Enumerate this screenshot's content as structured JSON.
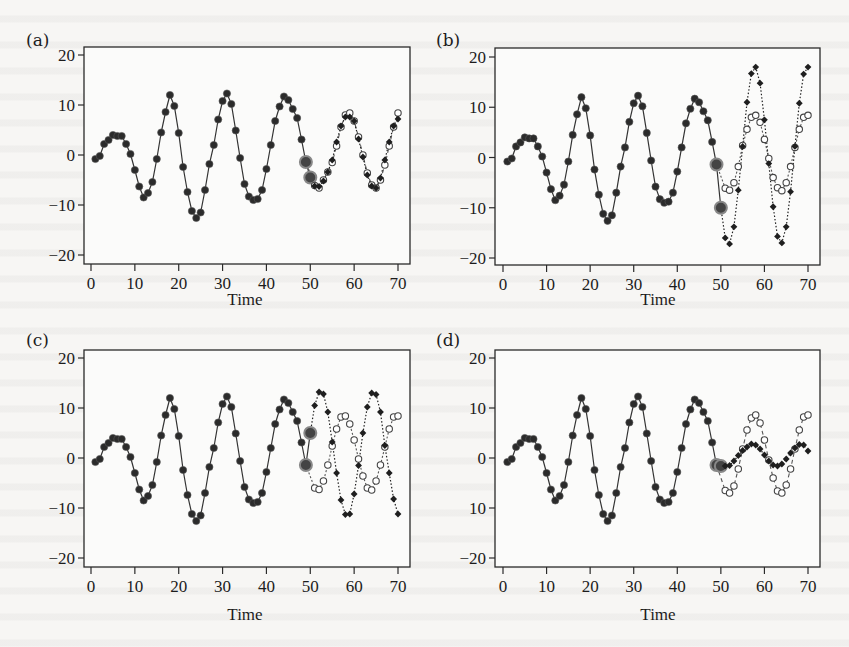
{
  "panels": [
    {
      "id": "a",
      "label": "(a)",
      "xlabel": "Time",
      "yticks": [
        "20",
        "10",
        "0",
        "−10",
        "−20"
      ],
      "xticks": [
        "0",
        "10",
        "20",
        "30",
        "40",
        "50",
        "60",
        "70"
      ]
    },
    {
      "id": "b",
      "label": "(b)",
      "xlabel": "Time",
      "yticks": [
        "20",
        "10",
        "0",
        "−10",
        "−20"
      ],
      "xticks": [
        "0",
        "10",
        "20",
        "30",
        "40",
        "50",
        "60",
        "70"
      ]
    },
    {
      "id": "c",
      "label": "(c)",
      "xlabel": "Time",
      "yticks": [
        "20",
        "10",
        "0",
        "−10",
        "−20"
      ],
      "xticks": [
        "0",
        "10",
        "20",
        "30",
        "40",
        "50",
        "60",
        "70"
      ]
    },
    {
      "id": "d",
      "label": "(d)",
      "xlabel": "Time",
      "yticks": [
        "20",
        "10",
        "0",
        "10",
        "−20"
      ],
      "xticks": [
        "0",
        "10",
        "20",
        "30",
        "40",
        "50",
        "60",
        "70"
      ]
    }
  ],
  "chart_data": [
    {
      "type": "line",
      "panel": "(a)",
      "title": "",
      "xlabel": "Time",
      "ylabel": "",
      "xlim": [
        0,
        70
      ],
      "ylim": [
        -20,
        20
      ],
      "grid": false,
      "legend": null,
      "series": [
        {
          "name": "observed",
          "style": "filled-circle-solid",
          "x": [
            1,
            2,
            3,
            4,
            5,
            6,
            7,
            8,
            9,
            10,
            11,
            12,
            13,
            14,
            15,
            16,
            17,
            18,
            19,
            20,
            21,
            22,
            23,
            24,
            25,
            26,
            27,
            28,
            29,
            30,
            31,
            32,
            33,
            34,
            35,
            36,
            37,
            38,
            39,
            40,
            41,
            42,
            43,
            44,
            45,
            46,
            47,
            48,
            49
          ],
          "values": [
            -0.8,
            -0.2,
            2.2,
            3.0,
            4.0,
            3.8,
            3.8,
            2.2,
            0.2,
            -3.0,
            -6.3,
            -8.5,
            -7.6,
            -5.4,
            -0.8,
            4.5,
            8.6,
            12.0,
            9.8,
            4.4,
            -2.4,
            -7.4,
            -11.2,
            -12.6,
            -11.5,
            -7.0,
            -1.8,
            2.0,
            7.1,
            10.8,
            12.3,
            10.2,
            4.9,
            -0.6,
            -5.8,
            -8.3,
            -9.0,
            -8.8,
            -7.0,
            -2.8,
            2.0,
            6.8,
            9.7,
            11.7,
            11.0,
            9.2,
            7.4,
            3.1,
            -1.4
          ]
        },
        {
          "name": "forecast",
          "style": "filled-diamond-dotted",
          "x": [
            50,
            51,
            52,
            53,
            54,
            55,
            56,
            57,
            58,
            59,
            60,
            61,
            62,
            63,
            64,
            65,
            66,
            67,
            68,
            69,
            70
          ],
          "values": [
            -4.5,
            -6.2,
            -6.3,
            -5.2,
            -3.4,
            -1.0,
            2.6,
            5.8,
            7.6,
            7.6,
            6.8,
            3.2,
            -0.4,
            -4.0,
            -6.2,
            -6.6,
            -4.6,
            -1.0,
            2.6,
            5.8,
            7.2
          ]
        },
        {
          "name": "actual",
          "style": "open-circle-dashed",
          "x": [
            50,
            51,
            52,
            53,
            54,
            55,
            56,
            57,
            58,
            59,
            60,
            61,
            62,
            63,
            64,
            65,
            66,
            67,
            68,
            69,
            70
          ],
          "values": [
            -4.5,
            -6.1,
            -6.6,
            -5.0,
            -3.4,
            -1.5,
            1.8,
            5.6,
            8.0,
            8.4,
            6.8,
            3.6,
            0.0,
            -3.6,
            -6.0,
            -6.6,
            -5.0,
            -2.0,
            1.8,
            5.6,
            8.4
          ]
        }
      ]
    },
    {
      "type": "line",
      "panel": "(b)",
      "title": "",
      "xlabel": "Time",
      "ylabel": "",
      "xlim": [
        0,
        70
      ],
      "ylim": [
        -20,
        20
      ],
      "grid": false,
      "legend": null,
      "series": [
        {
          "name": "observed",
          "style": "filled-circle-solid",
          "x": [
            1,
            2,
            3,
            4,
            5,
            6,
            7,
            8,
            9,
            10,
            11,
            12,
            13,
            14,
            15,
            16,
            17,
            18,
            19,
            20,
            21,
            22,
            23,
            24,
            25,
            26,
            27,
            28,
            29,
            30,
            31,
            32,
            33,
            34,
            35,
            36,
            37,
            38,
            39,
            40,
            41,
            42,
            43,
            44,
            45,
            46,
            47,
            48,
            49
          ],
          "values": [
            -0.8,
            -0.2,
            2.2,
            3.0,
            4.0,
            3.8,
            3.8,
            2.2,
            0.2,
            -3.0,
            -6.3,
            -8.5,
            -7.6,
            -5.4,
            -0.8,
            4.5,
            8.6,
            12.0,
            9.8,
            4.4,
            -2.4,
            -7.4,
            -11.2,
            -12.6,
            -11.5,
            -7.0,
            -1.8,
            2.0,
            7.1,
            10.8,
            12.3,
            10.2,
            4.9,
            -0.6,
            -5.8,
            -8.3,
            -9.0,
            -8.8,
            -7.0,
            -2.8,
            2.0,
            6.8,
            9.7,
            11.7,
            11.0,
            9.2,
            7.4,
            3.1,
            -1.4
          ]
        },
        {
          "name": "forecast",
          "style": "filled-diamond-dotted",
          "x": [
            50,
            51,
            52,
            53,
            54,
            55,
            56,
            57,
            58,
            59,
            60,
            61,
            62,
            63,
            64,
            65,
            66,
            67,
            68,
            69,
            70
          ],
          "values": [
            -10.0,
            -16.0,
            -17.2,
            -13.8,
            -6.5,
            2.2,
            11.0,
            16.7,
            18.0,
            14.8,
            7.5,
            -1.2,
            -9.8,
            -15.7,
            -17.0,
            -13.8,
            -6.8,
            2.2,
            10.8,
            16.6,
            18.0
          ]
        },
        {
          "name": "actual",
          "style": "open-circle-dotted",
          "x": [
            50,
            51,
            52,
            53,
            54,
            55,
            56,
            57,
            58,
            59,
            60,
            61,
            62,
            63,
            64,
            65,
            66,
            67,
            68,
            69,
            70
          ],
          "values": [
            -10.0,
            -6.1,
            -6.5,
            -5.0,
            -1.8,
            2.4,
            5.6,
            8.0,
            8.4,
            7.0,
            3.6,
            -0.2,
            -4.0,
            -6.0,
            -6.6,
            -5.0,
            -1.8,
            2.0,
            5.6,
            8.0,
            8.4
          ]
        }
      ]
    },
    {
      "type": "line",
      "panel": "(c)",
      "title": "",
      "xlabel": "Time",
      "ylabel": "",
      "xlim": [
        0,
        70
      ],
      "ylim": [
        -20,
        20
      ],
      "grid": false,
      "legend": null,
      "series": [
        {
          "name": "observed",
          "style": "filled-circle-solid",
          "x": [
            1,
            2,
            3,
            4,
            5,
            6,
            7,
            8,
            9,
            10,
            11,
            12,
            13,
            14,
            15,
            16,
            17,
            18,
            19,
            20,
            21,
            22,
            23,
            24,
            25,
            26,
            27,
            28,
            29,
            30,
            31,
            32,
            33,
            34,
            35,
            36,
            37,
            38,
            39,
            40,
            41,
            42,
            43,
            44,
            45,
            46,
            47,
            48,
            49
          ],
          "values": [
            -0.8,
            -0.2,
            2.2,
            3.0,
            4.0,
            3.8,
            3.8,
            2.2,
            0.2,
            -3.0,
            -6.3,
            -8.5,
            -7.6,
            -5.4,
            -0.8,
            4.5,
            8.6,
            12.0,
            9.8,
            4.4,
            -2.4,
            -7.4,
            -11.2,
            -12.6,
            -11.5,
            -7.0,
            -1.8,
            2.0,
            7.1,
            10.8,
            12.3,
            10.2,
            4.9,
            -0.6,
            -5.8,
            -8.3,
            -9.0,
            -8.8,
            -7.0,
            -2.8,
            2.0,
            6.8,
            9.7,
            11.7,
            11.0,
            9.2,
            7.4,
            3.1,
            -1.4
          ]
        },
        {
          "name": "forecast",
          "style": "filled-diamond-dotted",
          "x": [
            50,
            51,
            52,
            53,
            54,
            55,
            56,
            57,
            58,
            59,
            60,
            61,
            62,
            63,
            64,
            65,
            66,
            67,
            68,
            69,
            70
          ],
          "values": [
            5.0,
            10.5,
            13.2,
            12.8,
            9.2,
            3.2,
            -3.0,
            -8.4,
            -11.3,
            -11.2,
            -7.2,
            -1.5,
            5.0,
            10.2,
            13.0,
            12.7,
            9.2,
            2.5,
            -3.0,
            -8.2,
            -11.2
          ]
        },
        {
          "name": "actual",
          "style": "open-circle-dotted",
          "x": [
            50,
            51,
            52,
            53,
            54,
            55,
            56,
            57,
            58,
            59,
            60,
            61,
            62,
            63,
            64,
            65,
            66,
            67,
            68,
            69,
            70
          ],
          "values": [
            5.0,
            -6.0,
            -6.3,
            -4.6,
            -1.4,
            2.4,
            5.8,
            8.2,
            8.4,
            6.8,
            3.6,
            -0.2,
            -3.6,
            -6.0,
            -6.4,
            -4.6,
            -1.4,
            2.2,
            5.8,
            8.2,
            8.4
          ]
        }
      ]
    },
    {
      "type": "line",
      "panel": "(d)",
      "title": "",
      "xlabel": "Time",
      "ylabel": "",
      "xlim": [
        0,
        70
      ],
      "ylim": [
        -20,
        20
      ],
      "grid": false,
      "legend": null,
      "series": [
        {
          "name": "observed",
          "style": "filled-circle-solid",
          "x": [
            1,
            2,
            3,
            4,
            5,
            6,
            7,
            8,
            9,
            10,
            11,
            12,
            13,
            14,
            15,
            16,
            17,
            18,
            19,
            20,
            21,
            22,
            23,
            24,
            25,
            26,
            27,
            28,
            29,
            30,
            31,
            32,
            33,
            34,
            35,
            36,
            37,
            38,
            39,
            40,
            41,
            42,
            43,
            44,
            45,
            46,
            47,
            48,
            49
          ],
          "values": [
            -0.8,
            -0.2,
            2.2,
            3.0,
            4.0,
            3.8,
            3.8,
            2.2,
            0.2,
            -3.0,
            -6.3,
            -8.5,
            -7.6,
            -5.4,
            -0.8,
            4.5,
            8.6,
            12.0,
            9.8,
            4.4,
            -2.4,
            -7.4,
            -11.2,
            -12.6,
            -11.5,
            -7.0,
            -1.8,
            2.0,
            7.1,
            10.8,
            12.3,
            10.2,
            4.9,
            -0.6,
            -5.8,
            -8.3,
            -9.0,
            -8.8,
            -7.0,
            -2.8,
            2.0,
            6.8,
            9.7,
            11.7,
            11.0,
            9.2,
            7.4,
            3.1,
            -1.4
          ]
        },
        {
          "name": "forecast",
          "style": "filled-diamond-dotted",
          "x": [
            50,
            51,
            52,
            53,
            54,
            55,
            56,
            57,
            58,
            59,
            60,
            61,
            62,
            63,
            64,
            65,
            66,
            67,
            68,
            69,
            70
          ],
          "values": [
            -1.6,
            -1.6,
            -1.5,
            -0.6,
            0.5,
            1.5,
            2.2,
            2.8,
            2.6,
            1.8,
            0.6,
            -0.6,
            -1.4,
            -1.6,
            -1.2,
            -0.2,
            1.0,
            2.0,
            2.7,
            2.6,
            1.4
          ]
        },
        {
          "name": "actual",
          "style": "open-circle-dashed",
          "x": [
            50,
            51,
            52,
            53,
            54,
            55,
            56,
            57,
            58,
            59,
            60,
            61,
            62,
            63,
            64,
            65,
            66,
            67,
            68,
            69,
            70
          ],
          "values": [
            -1.6,
            -6.5,
            -7.0,
            -5.6,
            -2.2,
            1.8,
            5.6,
            8.0,
            8.6,
            7.0,
            3.6,
            -0.4,
            -4.0,
            -6.6,
            -7.0,
            -5.4,
            -2.2,
            1.8,
            5.6,
            8.2,
            8.6
          ]
        }
      ]
    }
  ]
}
